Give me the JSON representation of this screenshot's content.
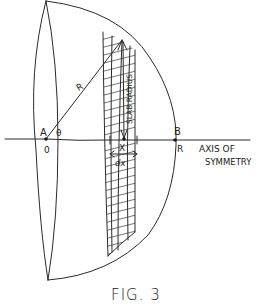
{
  "figure": {
    "caption": "FIG. 3",
    "labels": {
      "point_a": "A",
      "origin": "0",
      "angle": "θ",
      "radius": "R",
      "slab_radius": "SLAB RADIUS",
      "position_x": "X",
      "thickness": "dx",
      "point_b": "B",
      "end_r": "R",
      "axis_line1": "AXIS OF",
      "axis_line2": "SYMMETRY"
    }
  },
  "colors": {
    "ink": "#2a2a2a",
    "paper": "#ffffff"
  }
}
